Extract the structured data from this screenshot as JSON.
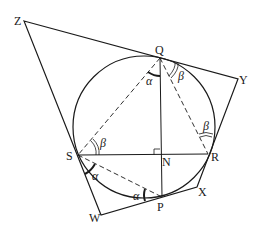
{
  "figure": {
    "type": "geometry",
    "colors": {
      "stroke": "#1a1a1a",
      "background": "#ffffff"
    },
    "circle": {
      "cx": 144,
      "cy": 127,
      "r": 71
    },
    "points": {
      "Z": {
        "label": "Z",
        "x": 24,
        "y": 21
      },
      "Q": {
        "label": "Q",
        "x": 160,
        "y": 58
      },
      "Y": {
        "label": "Y",
        "x": 238,
        "y": 79
      },
      "S": {
        "label": "S",
        "x": 78,
        "y": 155
      },
      "N": {
        "label": "N",
        "x": 160,
        "y": 155
      },
      "R": {
        "label": "R",
        "x": 208,
        "y": 154
      },
      "W": {
        "label": "W",
        "x": 101,
        "y": 215
      },
      "P": {
        "label": "P",
        "x": 162,
        "y": 197
      },
      "X": {
        "label": "X",
        "x": 197,
        "y": 187
      }
    },
    "solid_segments": [
      "ZY",
      "YX",
      "XW",
      "WZ",
      "QP",
      "SR"
    ],
    "dashed_segments": [
      "QS",
      "QR",
      "SP"
    ],
    "angle_labels": [
      {
        "text": "α",
        "at": "Q",
        "between": "QS-QP"
      },
      {
        "text": "β",
        "at": "Q",
        "between": "QY-QR"
      },
      {
        "text": "β",
        "at": "S",
        "between": "SR-SQ"
      },
      {
        "text": "β",
        "at": "R",
        "between": "RQ-RY"
      },
      {
        "text": "α",
        "at": "S",
        "between": "SW-SP"
      },
      {
        "text": "α",
        "at": "P",
        "between": "PS-PW"
      }
    ],
    "right_angle_marker": "N"
  }
}
